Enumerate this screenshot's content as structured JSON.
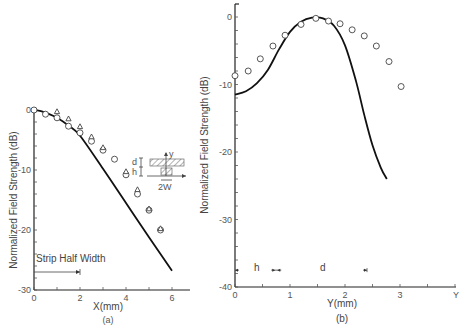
{
  "chart_data": [
    {
      "panel": "(a)",
      "type": "line+scatter",
      "xlabel": "X(mm)",
      "ylabel": "Normalized Field Strength (dB)",
      "xlim": [
        0,
        6.8
      ],
      "ylim": [
        -30,
        0
      ],
      "xticks": [
        0,
        2,
        4,
        6
      ],
      "yticks": [
        0,
        -10,
        -20,
        -30
      ],
      "x_minor_step": 1,
      "y_minor_step": 2,
      "annotation": "Strip Half Width",
      "annotation_arrow_x": [
        0,
        2
      ],
      "annotation_y": -27,
      "inset": {
        "labels": [
          "y",
          "d",
          "h",
          "2W"
        ]
      },
      "series": [
        {
          "name": "theory",
          "style": "line",
          "x": [
            0,
            0.3,
            0.6,
            1.0,
            1.5,
            2.0,
            3.0,
            4.0,
            5.0,
            6.0
          ],
          "y": [
            0,
            -0.2,
            -0.6,
            -1.3,
            -2.6,
            -4.3,
            -9.8,
            -15.5,
            -21.2,
            -26.8
          ]
        },
        {
          "name": "measured (circles)",
          "style": "circle",
          "x": [
            0,
            0.5,
            1.0,
            1.5,
            2.0,
            2.5,
            3.0,
            3.5,
            4.0,
            4.5,
            5.0,
            5.5
          ],
          "y": [
            0,
            -0.7,
            -1.3,
            -2.7,
            -3.8,
            -5.2,
            -6.7,
            -8.2,
            -10.8,
            -14.0,
            -16.7,
            -20.0
          ]
        },
        {
          "name": "measured (triangles)",
          "style": "triangle",
          "x": [
            1.0,
            1.5,
            2.0,
            2.5,
            3.0,
            4.0,
            4.5,
            5.0,
            5.5
          ],
          "y": [
            -0.3,
            -1.5,
            -2.8,
            -4.5,
            -6.3,
            -10.3,
            -13.3,
            -16.5,
            -19.8
          ]
        }
      ]
    },
    {
      "panel": "(b)",
      "type": "line+scatter",
      "xlabel": "Y(mm)",
      "ylabel": "Normalized Field Strength (dB)",
      "xlim": [
        0,
        4
      ],
      "ylim": [
        -40,
        2
      ],
      "xticks": [
        0,
        1,
        2,
        3
      ],
      "xtick_end_label": "Y",
      "yticks": [
        0,
        -10,
        -20,
        -30,
        -40
      ],
      "x_minor_step": 0.5,
      "y_minor_step": 2,
      "markers": {
        "h_label": "h",
        "d_label": "d",
        "h_range": [
          0,
          0.75
        ],
        "d_range": [
          0.75,
          2.4
        ],
        "marker_y": -37.5
      },
      "series": [
        {
          "name": "theory",
          "style": "line",
          "x": [
            0,
            0.2,
            0.4,
            0.6,
            0.8,
            1.0,
            1.2,
            1.4,
            1.6,
            1.8,
            2.0,
            2.2,
            2.35,
            2.5,
            2.65,
            2.76
          ],
          "y": [
            -11.5,
            -11.0,
            -9.8,
            -7.8,
            -4.8,
            -2.2,
            -0.7,
            -0.1,
            -0.2,
            -1.3,
            -4.2,
            -9.5,
            -14.5,
            -19.0,
            -22.3,
            -24.0
          ]
        },
        {
          "name": "measured",
          "style": "circle",
          "x": [
            0.0,
            0.24,
            0.46,
            0.69,
            0.91,
            1.2,
            1.47,
            1.7,
            1.91,
            2.13,
            2.35,
            2.57,
            2.8,
            3.02
          ],
          "y": [
            -8.7,
            -8.0,
            -6.2,
            -4.3,
            -2.7,
            -1.1,
            -0.2,
            -0.6,
            -1.0,
            -1.9,
            -2.8,
            -4.3,
            -6.6,
            -10.3
          ]
        }
      ]
    }
  ],
  "labels": {
    "a_xlabel": "X(mm)",
    "a_caption": "(a)",
    "a_ylabel": "Normalized Field Strength (dB)",
    "a_annotation": "Strip Half Width",
    "b_xlabel": "Y(mm)",
    "b_caption": "(b)",
    "b_ylabel": "Normalized Field Strength (dB)",
    "b_h": "h",
    "b_d": "d",
    "inset_y": "y",
    "inset_d": "d",
    "inset_h": "h",
    "inset_2w": "2W"
  }
}
